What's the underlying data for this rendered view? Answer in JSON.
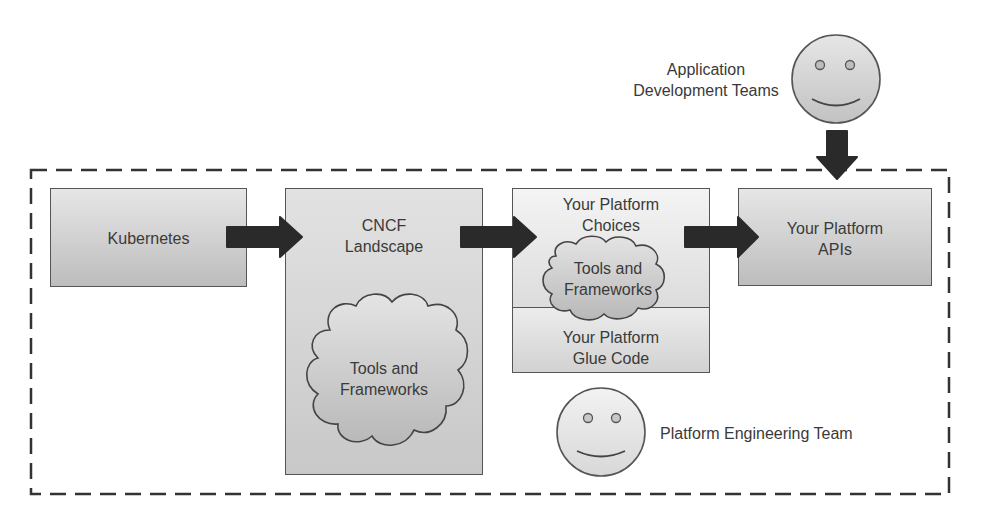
{
  "diagram": {
    "boundary": {
      "name": "platform-boundary",
      "style": "dashed"
    },
    "nodes": {
      "kubernetes": {
        "label": "Kubernetes"
      },
      "cncf": {
        "title_line1": "CNCF",
        "title_line2": "Landscape",
        "cloud_line1": "Tools and",
        "cloud_line2": "Frameworks"
      },
      "platform_choices": {
        "title_line1": "Your Platform",
        "title_line2": "Choices",
        "cloud_line1": "Tools and",
        "cloud_line2": "Frameworks"
      },
      "glue_code": {
        "line1": "Your Platform",
        "line2": "Glue Code"
      },
      "platform_apis": {
        "line1": "Your Platform",
        "line2": "APIs"
      }
    },
    "actors": {
      "app_teams": {
        "line1": "Application",
        "line2": "Development Teams",
        "icon": "smiley-face-icon"
      },
      "platform_team": {
        "label": "Platform Engineering Team",
        "icon": "smiley-face-icon"
      }
    },
    "edges": [
      {
        "from": "Kubernetes",
        "to": "CNCF Landscape"
      },
      {
        "from": "CNCF Landscape",
        "to": "Your Platform Choices"
      },
      {
        "from": "Your Platform Choices",
        "to": "Your Platform APIs"
      },
      {
        "from": "Application Development Teams",
        "to": "Your Platform APIs"
      }
    ],
    "colors": {
      "arrow": "#2a2a2a",
      "border": "#555555",
      "box_fill_dark": "#c4c4c4",
      "box_fill_light": "#dedede",
      "text": "#3a3a3a"
    }
  }
}
